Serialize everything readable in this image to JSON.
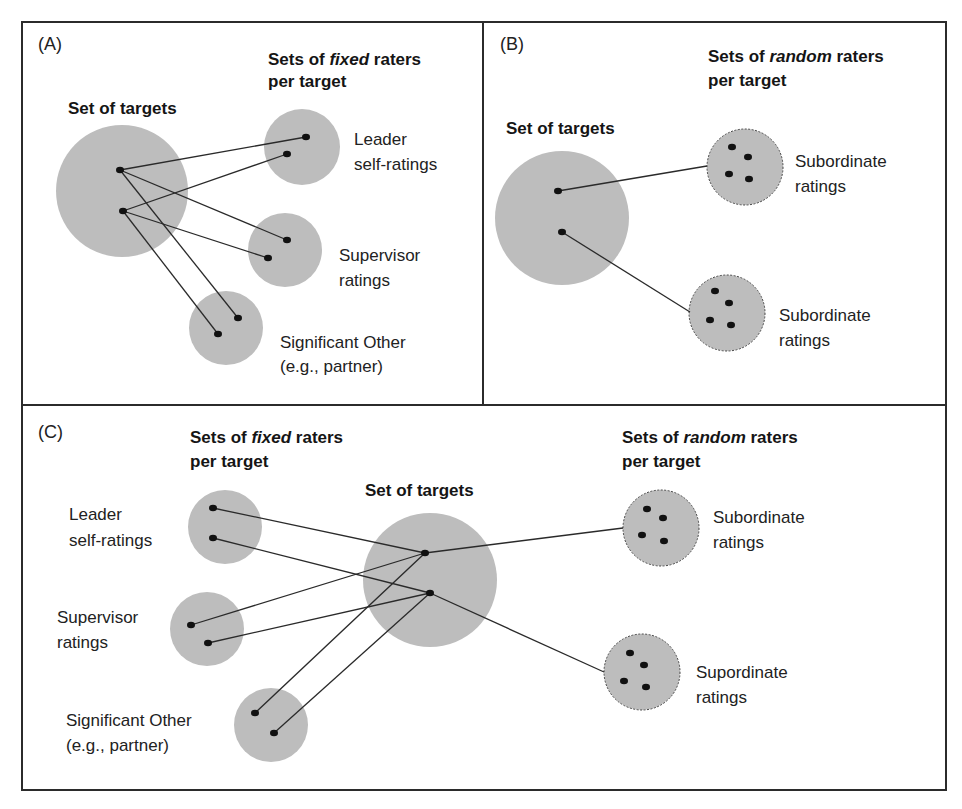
{
  "panels": {
    "a": {
      "tag": "(A)",
      "targets_title": "Set of targets",
      "raters_title_pre": "Sets of ",
      "raters_title_em": "fixed",
      "raters_title_post": " raters",
      "raters_title_line2": "per target",
      "groups": [
        {
          "line1": "Leader",
          "line2": "self-ratings"
        },
        {
          "line1": "Supervisor",
          "line2": "ratings"
        },
        {
          "line1": "Significant Other",
          "line2": "(e.g., partner)"
        }
      ]
    },
    "b": {
      "tag": "(B)",
      "targets_title": "Set of targets",
      "raters_title_pre": "Sets of ",
      "raters_title_em": "random",
      "raters_title_post": " raters",
      "raters_title_line2": "per target",
      "groups": [
        {
          "line1": "Subordinate",
          "line2": "ratings"
        },
        {
          "line1": "Subordinate",
          "line2": "ratings"
        }
      ]
    },
    "c": {
      "tag": "(C)",
      "targets_title": "Set of targets",
      "fixed_title_pre": "Sets of ",
      "fixed_title_em": "fixed",
      "fixed_title_post": " raters",
      "fixed_title_line2": "per target",
      "random_title_pre": "Sets of ",
      "random_title_em": "random",
      "random_title_post": " raters",
      "random_title_line2": "per target",
      "fixed_groups": [
        {
          "line1": "Leader",
          "line2": "self-ratings"
        },
        {
          "line1": "Supervisor",
          "line2": "ratings"
        },
        {
          "line1": "Significant Other",
          "line2": "(e.g., partner)"
        }
      ],
      "random_groups": [
        {
          "line1": "Subordinate",
          "line2": "ratings"
        },
        {
          "line1": "Supordinate",
          "line2": "ratings"
        }
      ]
    }
  },
  "colors": {
    "circle_fill": "#bdbdbd",
    "dot": "#111111",
    "line": "#2a2a2a",
    "frame": "#2b2b2b"
  }
}
